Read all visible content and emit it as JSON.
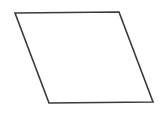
{
  "diagram": {
    "shape": "parallelogram",
    "fill": "#ffffff",
    "stroke": "#3a3a3a",
    "background": "#ffffff"
  }
}
